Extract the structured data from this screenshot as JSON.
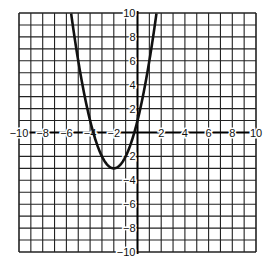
{
  "chart_data": {
    "type": "line",
    "title": "",
    "xlabel": "",
    "ylabel": "",
    "xlim": [
      -10,
      10
    ],
    "ylim": [
      -10,
      10
    ],
    "grid": true,
    "grid_step": 1,
    "x_ticks": [
      -10,
      -8,
      -6,
      -4,
      -2,
      2,
      4,
      6,
      8,
      10
    ],
    "y_ticks": [
      10,
      8,
      6,
      4,
      2,
      -2,
      -4,
      -6,
      -8,
      -10
    ],
    "x_tick_labels": [
      "−10",
      "−8",
      "−6",
      "−4",
      "−2",
      "2",
      "4",
      "6",
      "8",
      "10"
    ],
    "y_tick_labels": [
      "10",
      "8",
      "6",
      "4",
      "2",
      "−2",
      "−4",
      "−6",
      "−8",
      "−10"
    ],
    "series": [
      {
        "name": "parabola",
        "equation": "y = (x + 2)^2 - 3",
        "vertex": [
          -2,
          -3
        ],
        "x_intercepts": [
          -3.73,
          -0.27
        ],
        "color": "#111111"
      }
    ],
    "annotations": []
  }
}
